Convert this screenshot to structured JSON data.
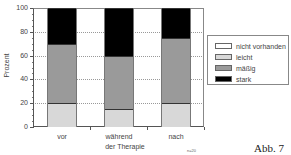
{
  "chart_data": {
    "type": "bar",
    "stacked": true,
    "title": "",
    "xlabel": "der Therapie",
    "ylabel": "Prozent",
    "ylim": [
      0,
      100
    ],
    "yticks": [
      0,
      20,
      40,
      60,
      80,
      100
    ],
    "grid": true,
    "legend_position": "right",
    "categories": [
      "vor",
      "während",
      "nach"
    ],
    "series": [
      {
        "name": "leicht",
        "color": "#d8d8d8",
        "values": [
          20,
          15,
          20
        ]
      },
      {
        "name": "mäßig",
        "color": "#9a9a9a",
        "values": [
          50,
          45,
          55
        ]
      },
      {
        "name": "stark",
        "color": "#000000",
        "values": [
          30,
          40,
          25
        ]
      },
      {
        "name": "nicht vorhanden",
        "color": "#ffffff",
        "values": [
          0,
          0,
          0
        ]
      }
    ],
    "annotations": [
      "n=20",
      "Abb. 7"
    ]
  },
  "axis": {
    "ylabel": "Prozent",
    "xtitle": "der Therapie",
    "yticks": [
      "0",
      "20",
      "40",
      "60",
      "80",
      "100"
    ],
    "categories": [
      "vor",
      "während",
      "nach"
    ]
  },
  "legend": {
    "items": [
      {
        "label": "nicht vorhanden",
        "color": "#ffffff"
      },
      {
        "label": "leicht",
        "color": "#d8d8d8"
      },
      {
        "label": "mäßig",
        "color": "#9a9a9a"
      },
      {
        "label": "stark",
        "color": "#000000"
      }
    ]
  },
  "footer": {
    "note": "n=20",
    "figure_label": "Abb. 7"
  }
}
